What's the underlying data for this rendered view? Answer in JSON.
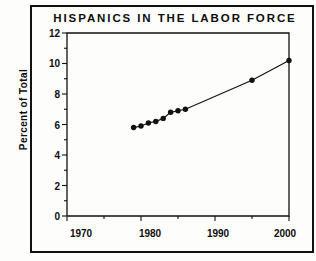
{
  "figure": {
    "title": "HISPANICS IN THE LABOR FORCE"
  },
  "chart_data": {
    "type": "line",
    "title": "HISPANICS IN THE LABOR FORCE",
    "xlabel": "",
    "ylabel": "Percent of Total",
    "xlim": [
      1970,
      2000
    ],
    "ylim": [
      0,
      12
    ],
    "xticks": [
      1970,
      1980,
      1990,
      2000
    ],
    "xticklabels": [
      "1970",
      "1980",
      "1990",
      "2000"
    ],
    "xminorticks": [
      1975,
      1985,
      1995
    ],
    "yticks": [
      0,
      2,
      4,
      6,
      8,
      10,
      12
    ],
    "yticklabels": [
      "0",
      "2",
      "4",
      "6",
      "8",
      "10",
      "12"
    ],
    "yminorticks": [
      1,
      3,
      5,
      7,
      9,
      11
    ],
    "grid": false,
    "legend": false,
    "marker": "filled-circle",
    "line_color": "#111111",
    "marker_color": "#111111",
    "x": [
      1979,
      1980,
      1981,
      1982,
      1983,
      1984,
      1985,
      1986,
      1995,
      2000
    ],
    "y": [
      5.8,
      5.9,
      6.1,
      6.2,
      6.4,
      6.8,
      6.9,
      7.0,
      8.9,
      10.2
    ],
    "series": [
      {
        "name": "Hispanic share of labor force",
        "x": [
          1979,
          1980,
          1981,
          1982,
          1983,
          1984,
          1985,
          1986,
          1995,
          2000
        ],
        "values": [
          5.8,
          5.9,
          6.1,
          6.2,
          6.4,
          6.8,
          6.9,
          7.0,
          8.9,
          10.2
        ]
      }
    ]
  }
}
